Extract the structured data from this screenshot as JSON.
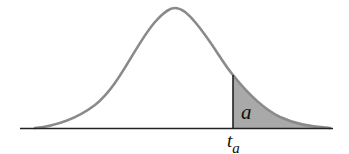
{
  "diagram": {
    "type": "t-distribution upper tail area",
    "area_label": "a",
    "critical_value_label": "t",
    "critical_value_subscript": "a",
    "colors": {
      "curve": "#8a8a8a",
      "shade": "#a9a9a9",
      "axis": "#222222",
      "cutoff_line": "#222222"
    }
  }
}
